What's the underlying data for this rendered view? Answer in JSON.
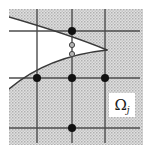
{
  "figure": {
    "kind": "domain-with-grid-and-parabola",
    "canvas": {
      "width": 152,
      "height": 155,
      "background": "#ffffff"
    },
    "shaded_region": {
      "name": "subdomain-shading",
      "x": 9,
      "y": 9,
      "width": 134,
      "height": 136,
      "fill": "#cccccc",
      "pattern": "halftone-stipple",
      "description": "gray stippled square domain"
    },
    "grid": {
      "stroke": "#4d4d4d",
      "stroke_width": 1.4,
      "vertical_lines": [
        {
          "name": "grid-line-v1",
          "x": 37,
          "y1": 9,
          "y2": 143
        },
        {
          "name": "grid-line-v2",
          "x": 72,
          "y1": 9,
          "y2": 143
        },
        {
          "name": "grid-line-v3",
          "x": 105,
          "y1": 9,
          "y2": 143
        }
      ],
      "horizontal_lines": [
        {
          "name": "grid-line-h1",
          "y": 31,
          "x1": 9,
          "x2": 140
        },
        {
          "name": "grid-line-h2",
          "y": 78,
          "x1": 9,
          "x2": 140
        },
        {
          "name": "grid-line-h3",
          "y": 128,
          "x1": 9,
          "x2": 140
        }
      ]
    },
    "curve": {
      "name": "interface-parabola",
      "stroke": "#3a3a3a",
      "stroke_width": 1.5,
      "opening": "left",
      "vertex": {
        "x": 107,
        "y": 50
      },
      "upper_branch_path": "M 9,17 C 40,26 78,38 107,50",
      "lower_branch_path": "M 107,50 C 70,54 36,66 9,89",
      "white_interior": true
    },
    "nodes": [
      {
        "name": "node-filled-top",
        "x": 72,
        "y": 31,
        "r": 4.0,
        "style": "filled",
        "fill": "#111111"
      },
      {
        "name": "node-open-upper-crossing",
        "x": 72,
        "y": 45,
        "r": 2.6,
        "style": "open",
        "fill": "#b3b3b3",
        "stroke": "#444444"
      },
      {
        "name": "node-open-lower-crossing",
        "x": 72,
        "y": 54,
        "r": 2.6,
        "style": "open",
        "fill": "#b3b3b3",
        "stroke": "#444444"
      },
      {
        "name": "node-filled-mid-left",
        "x": 37,
        "y": 78,
        "r": 4.0,
        "style": "filled",
        "fill": "#111111"
      },
      {
        "name": "node-filled-mid-center",
        "x": 72,
        "y": 78,
        "r": 4.0,
        "style": "filled",
        "fill": "#111111"
      },
      {
        "name": "node-filled-mid-right",
        "x": 105,
        "y": 78,
        "r": 4.0,
        "style": "filled",
        "fill": "#111111"
      },
      {
        "name": "node-filled-bottom",
        "x": 72,
        "y": 128,
        "r": 4.0,
        "style": "filled",
        "fill": "#111111"
      }
    ],
    "label": {
      "name": "omega-subdomain-label",
      "symbol": "Ω",
      "subscript": "j",
      "box": {
        "x": 109,
        "y": 93,
        "width": 26,
        "height": 24,
        "fill": "#ffffff"
      }
    }
  }
}
